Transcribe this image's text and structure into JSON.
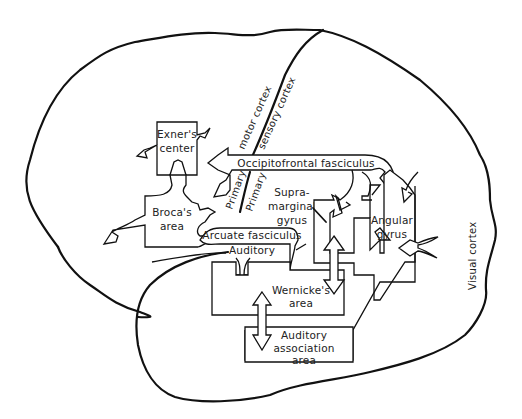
{
  "diagram": {
    "regions": {
      "exners_center": {
        "line1": "Exner's",
        "line2": "center"
      },
      "brocas_area": {
        "line1": "Broca's",
        "line2": "area"
      },
      "supramarginal_gyrus": {
        "line1": "Supra-",
        "line2": "marginal",
        "line3": "gyrus"
      },
      "angular_gyrus": {
        "line1": "Angular",
        "line2": "gyrus"
      },
      "wernickes_area": {
        "line1": "Wernicke's",
        "line2": "area"
      },
      "auditory_association_area": {
        "line1": "Auditory",
        "line2": "association",
        "line3": "area"
      },
      "auditory": "Auditory"
    },
    "pathways": {
      "occipitofrontal": "Occipitofrontal fasciculus",
      "arcuate": "Arcuate fasciculus"
    },
    "cortex_labels": {
      "motor_cortex": "motor cortex",
      "sensory_cortex": "sensory cortex",
      "primary_1": "Primary",
      "primary_2": "Primary",
      "visual_cortex": "Visual cortex"
    }
  }
}
